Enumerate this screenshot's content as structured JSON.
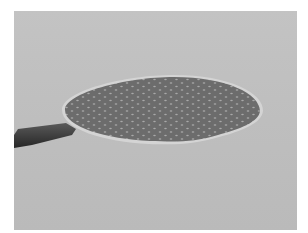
{
  "image": {
    "description": "Grayscale photograph of a perforated circular disc (paddle) with a dark handle, lying on a light gray surface",
    "colors": {
      "background": "#bfbfbf",
      "disc": "#6e6e6e",
      "disc_rim": "#d6d6d6",
      "holes": "#a9a9a9",
      "handle": "#3a3a3a",
      "border": "#ffffff"
    }
  }
}
